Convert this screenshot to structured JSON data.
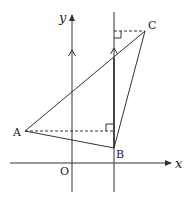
{
  "diagram": {
    "type": "coordinate-geometry",
    "colors": {
      "line": "#333333",
      "background": "#ffffff",
      "label": "#222222"
    },
    "axes": {
      "x_label": "x",
      "y_label": "y",
      "origin_label": "O"
    },
    "points": {
      "A": {
        "label": "A"
      },
      "B": {
        "label": "B"
      },
      "C": {
        "label": "C"
      }
    },
    "elements": [
      "triangle ABC",
      "vertical line through B parallel to y-axis",
      "dashed perpendicular from A to vertical line through B",
      "dashed perpendicular from C to vertical line through B",
      "right-angle markers at feet of perpendiculars",
      "parallel marks on y-axis and vertical line"
    ]
  }
}
